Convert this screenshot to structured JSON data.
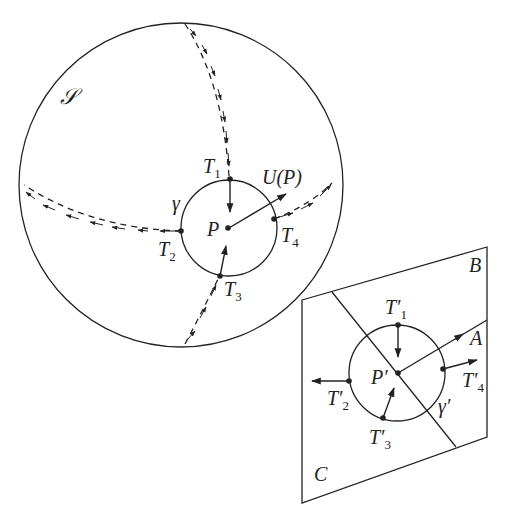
{
  "figure": {
    "sphere": {
      "label": "𝒮",
      "center": [
        181,
        185
      ],
      "radius": 162,
      "stroke_color": "#222222"
    },
    "curve_gamma": {
      "label": "γ",
      "center": [
        230,
        229
      ],
      "radius": 49
    },
    "point_P": {
      "label": "P",
      "position": [
        230,
        229
      ]
    },
    "vector_U": {
      "label": "U(P)"
    },
    "sphere_points": [
      {
        "id": "T1",
        "label": "T",
        "subscript": "1"
      },
      {
        "id": "T2",
        "label": "T",
        "subscript": "2"
      },
      {
        "id": "T3",
        "label": "T",
        "subscript": "3"
      },
      {
        "id": "T4",
        "label": "T",
        "subscript": "4"
      }
    ],
    "plane": {
      "region_labels": {
        "A": "A",
        "B": "B",
        "C": "C"
      },
      "curve_label": "γ′",
      "point_label": "P′",
      "points": [
        {
          "id": "T1p",
          "label": "T′",
          "subscript": "1"
        },
        {
          "id": "T2p",
          "label": "T′",
          "subscript": "2"
        },
        {
          "id": "T3p",
          "label": "T′",
          "subscript": "3"
        },
        {
          "id": "T4p",
          "label": "T′",
          "subscript": "4"
        }
      ]
    }
  }
}
